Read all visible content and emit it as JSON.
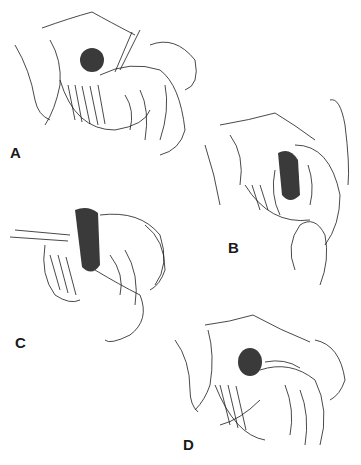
{
  "figure": {
    "ink_color": "#1a1a1a",
    "dark_fill": "#3a3a3a",
    "panels": [
      {
        "id": "A",
        "label": "A"
      },
      {
        "id": "B",
        "label": "B"
      },
      {
        "id": "C",
        "label": "C"
      },
      {
        "id": "D",
        "label": "D"
      }
    ]
  }
}
